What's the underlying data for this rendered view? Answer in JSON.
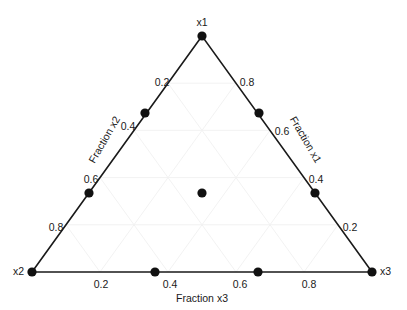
{
  "chart_data": {
    "type": "scatter",
    "subtype": "ternary-simplex-lattice",
    "title": "",
    "grid": true,
    "legend": null,
    "colors": {
      "point": "#111111",
      "frame": "#1a1a1a",
      "grid": "#f0f0f0",
      "background": "#ffffff",
      "text": "#1a1a1a"
    },
    "vertices": [
      {
        "name": "x1",
        "label": "x1",
        "position": "top",
        "px": [
          202,
          36
        ],
        "coords": [
          1,
          0,
          0
        ]
      },
      {
        "name": "x2",
        "label": "x2",
        "position": "bottom-left",
        "px": [
          32,
          272
        ],
        "coords": [
          0,
          1,
          0
        ]
      },
      {
        "name": "x3",
        "label": "x3",
        "position": "bottom-right",
        "px": [
          372,
          272
        ],
        "coords": [
          0,
          0,
          1
        ]
      }
    ],
    "axes": [
      {
        "id": "x1",
        "title": "Fraction  x1",
        "side": "right",
        "rotation_deg": -60,
        "ticks": [
          0.2,
          0.4,
          0.6,
          0.8
        ],
        "tick_labels": [
          "0.2",
          "0.4",
          "0.6",
          "0.8"
        ],
        "range": [
          0,
          1
        ]
      },
      {
        "id": "x2",
        "title": "Fraction  x2",
        "side": "left",
        "rotation_deg": 60,
        "ticks": [
          0.2,
          0.4,
          0.6,
          0.8
        ],
        "tick_labels": [
          "0.2",
          "0.4",
          "0.6",
          "0.8"
        ],
        "range": [
          0,
          1
        ]
      },
      {
        "id": "x3",
        "title": "Fraction  x3",
        "side": "bottom",
        "rotation_deg": 0,
        "ticks": [
          0.2,
          0.4,
          0.6,
          0.8
        ],
        "tick_labels": [
          "0.2",
          "0.4",
          "0.6",
          "0.8"
        ],
        "range": [
          0,
          1
        ]
      }
    ],
    "points": [
      {
        "x1": 1.0,
        "x2": 0.0,
        "x3": 0.0,
        "px": [
          202,
          36
        ],
        "kind": "vertex"
      },
      {
        "x1": 0.0,
        "x2": 1.0,
        "x3": 0.0,
        "px": [
          32,
          272
        ],
        "kind": "vertex"
      },
      {
        "x1": 0.0,
        "x2": 0.0,
        "x3": 1.0,
        "px": [
          372,
          272
        ],
        "kind": "vertex"
      },
      {
        "x1": 0.6667,
        "x2": 0.3333,
        "x3": 0.0,
        "px": [
          145,
          113
        ],
        "kind": "edge"
      },
      {
        "x1": 0.3333,
        "x2": 0.6667,
        "x3": 0.0,
        "px": [
          89,
          193
        ],
        "kind": "edge"
      },
      {
        "x1": 0.6667,
        "x2": 0.0,
        "x3": 0.3333,
        "px": [
          259,
          113
        ],
        "kind": "edge"
      },
      {
        "x1": 0.3333,
        "x2": 0.0,
        "x3": 0.6667,
        "px": [
          315,
          193
        ],
        "kind": "edge"
      },
      {
        "x1": 0.0,
        "x2": 0.6667,
        "x3": 0.3333,
        "px": [
          155,
          272
        ],
        "kind": "edge"
      },
      {
        "x1": 0.0,
        "x2": 0.3333,
        "x3": 0.6667,
        "px": [
          258,
          272
        ],
        "kind": "edge"
      },
      {
        "x1": 0.3333,
        "x2": 0.3333,
        "x3": 0.3333,
        "px": [
          202,
          193
        ],
        "kind": "centroid"
      }
    ],
    "tick_label_placements": [
      {
        "axis": "x3",
        "value": "0.2",
        "px": [
          101,
          285
        ],
        "rotation_deg": 0
      },
      {
        "axis": "x3",
        "value": "0.4",
        "px": [
          170,
          285
        ],
        "rotation_deg": 0
      },
      {
        "axis": "x3",
        "value": "0.6",
        "px": [
          240,
          285
        ],
        "rotation_deg": 0
      },
      {
        "axis": "x3",
        "value": "0.8",
        "px": [
          309,
          285
        ],
        "rotation_deg": 0
      },
      {
        "axis": "x2",
        "value": "0.2",
        "px": [
          162,
          83
        ],
        "rotation_deg": 0
      },
      {
        "axis": "x2",
        "value": "0.4",
        "px": [
          128,
          127
        ],
        "rotation_deg": 0
      },
      {
        "axis": "x2",
        "value": "0.6",
        "px": [
          91,
          180
        ],
        "rotation_deg": 0
      },
      {
        "axis": "x2",
        "value": "0.8",
        "px": [
          56,
          228
        ],
        "rotation_deg": 0
      },
      {
        "axis": "x1",
        "value": "0.8",
        "px": [
          247,
          83
        ],
        "rotation_deg": 0
      },
      {
        "axis": "x1",
        "value": "0.6",
        "px": [
          282,
          132
        ],
        "rotation_deg": 0
      },
      {
        "axis": "x1",
        "value": "0.4",
        "px": [
          316,
          180
        ],
        "rotation_deg": 0
      },
      {
        "axis": "x1",
        "value": "0.2",
        "px": [
          350,
          228
        ],
        "rotation_deg": 0
      }
    ],
    "axis_title_placements": [
      {
        "axis": "x2",
        "px": [
          105,
          140
        ],
        "rotation_deg": -60
      },
      {
        "axis": "x1",
        "px": [
          305,
          140
        ],
        "rotation_deg": 60
      },
      {
        "axis": "x3",
        "px": [
          202,
          299
        ],
        "rotation_deg": 0
      }
    ]
  }
}
